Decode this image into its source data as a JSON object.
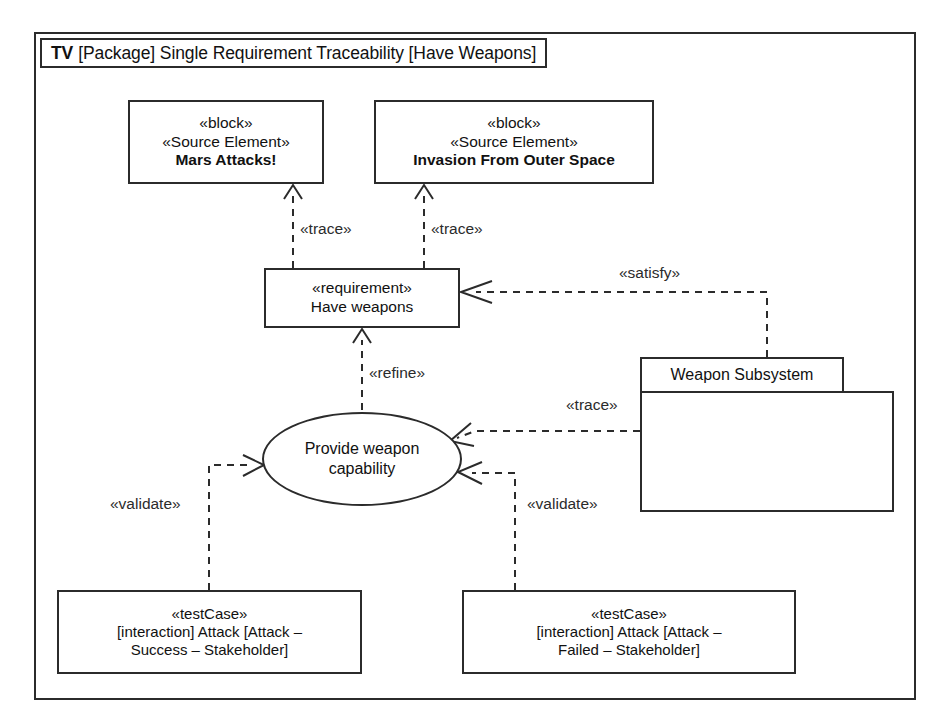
{
  "diagram": {
    "frame": {
      "tv_label": "TV",
      "title": "[Package] Single Requirement Traceability [Have Weapons]"
    },
    "nodes": {
      "block_mars": {
        "stereotype_1": "«leblock»",
        "stereotype_block": "«block»",
        "stereotype_source": "«Source Element»",
        "name": "Mars Attacks!"
      },
      "block_invasion": {
        "stereotype_block": "«block»",
        "stereotype_source": "«Source Element»",
        "name": "Invasion From Outer Space"
      },
      "requirement": {
        "stereotype": "«requirement»",
        "name": "Have weapons"
      },
      "use_case": {
        "line1": "Provide weapon",
        "line2": "capability"
      },
      "package_weapon_subsystem": {
        "name": "Weapon Subsystem"
      },
      "test_case_success": {
        "stereotype": "«testCase»",
        "line1": "[interaction] Attack [Attack –",
        "line2": "Success – Stakeholder]"
      },
      "test_case_failed": {
        "stereotype": "«testCase»",
        "line1": "[interaction] Attack [Attack –",
        "line2": "Failed – Stakeholder]"
      }
    },
    "edges": {
      "trace_left": "«trace»",
      "trace_right": "«trace»",
      "satisfy": "«satisfy»",
      "refine": "«refine»",
      "trace_subsystem": "«trace»",
      "validate_left": "«validate»",
      "validate_right": "«validate»"
    },
    "colors": {
      "stroke": "#2b2b2b",
      "background": "#ffffff"
    }
  }
}
